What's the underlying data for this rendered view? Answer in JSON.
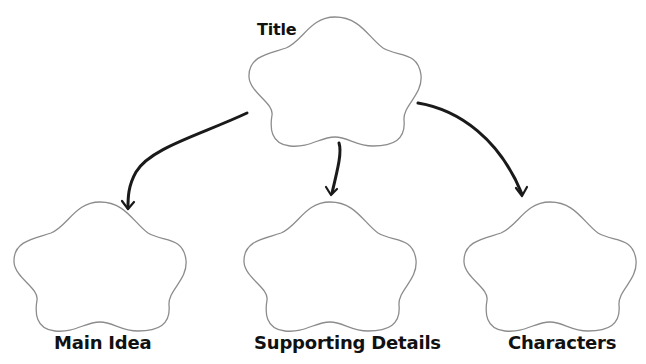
{
  "diagram": {
    "type": "concept-map",
    "colors": {
      "background": "#ffffff",
      "cloud_stroke": "#8c8c8c",
      "arrow": "#1a1a1a",
      "text": "#111111"
    },
    "root": {
      "label": "Title",
      "shape": "cloud"
    },
    "children": [
      {
        "label": "Main Idea",
        "shape": "cloud"
      },
      {
        "label": "Supporting Details",
        "shape": "cloud"
      },
      {
        "label": "Characters",
        "shape": "cloud"
      }
    ],
    "edges": [
      {
        "from": "Title",
        "to": "Main Idea"
      },
      {
        "from": "Title",
        "to": "Supporting Details"
      },
      {
        "from": "Title",
        "to": "Characters"
      }
    ]
  }
}
